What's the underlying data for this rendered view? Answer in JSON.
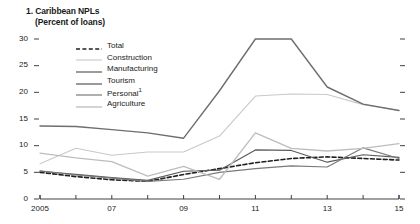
{
  "panel": {
    "number": "1.",
    "title": "1. Caribbean NPLs",
    "subtitle": "(Percent of loans)"
  },
  "chart_data": {
    "type": "line",
    "title": "1. Caribbean NPLs",
    "subtitle": "(Percent of loans)",
    "xlabel": "",
    "ylabel": "",
    "ylim": [
      0,
      30
    ],
    "xlim": [
      2005,
      2015
    ],
    "yticks": [
      0,
      5,
      10,
      15,
      20,
      25,
      30
    ],
    "ytick_labels": [
      "0",
      "5",
      "10",
      "15",
      "20",
      "25",
      "30"
    ],
    "x": [
      2005,
      2006,
      2007,
      2008,
      2009,
      2010,
      2011,
      2012,
      2013,
      2014,
      2015
    ],
    "xticks": [
      2005,
      2006,
      2007,
      2008,
      2009,
      2010,
      2011,
      2012,
      2013,
      2014,
      2015
    ],
    "xtick_labels": [
      "2005",
      "",
      "07",
      "",
      "09",
      "",
      "11",
      "",
      "13",
      "",
      "15"
    ],
    "grid": false,
    "legend_position": "upper-center",
    "right_axis_ticks": true,
    "series": [
      {
        "name": "Total",
        "style": "dashed",
        "color": "#1f1f1f",
        "width": 1.6,
        "values": [
          5.0,
          4.2,
          3.6,
          3.3,
          4.6,
          5.7,
          6.8,
          7.6,
          7.9,
          7.6,
          7.3
        ]
      },
      {
        "name": "Construction",
        "style": "solid",
        "color": "#c9c9c9",
        "width": 1.1,
        "values": [
          6.6,
          9.5,
          8.2,
          8.8,
          8.8,
          11.8,
          19.3,
          19.7,
          19.6,
          17.7,
          16.6
        ]
      },
      {
        "name": "Manufacturing",
        "style": "solid",
        "color": "#5a5a5a",
        "width": 1.2,
        "values": [
          5.2,
          4.6,
          4.0,
          3.5,
          5.2,
          5.4,
          9.2,
          9.1,
          6.9,
          8.3,
          7.8
        ]
      },
      {
        "name": "Tourism",
        "style": "solid",
        "color": "#6e6e6e",
        "width": 1.4,
        "values": [
          13.7,
          13.6,
          13.0,
          12.4,
          11.4,
          20.3,
          30.0,
          30.0,
          21.0,
          17.8,
          16.6
        ]
      },
      {
        "name": "Personal",
        "style": "solid",
        "color": "#7a7a7a",
        "width": 1.2,
        "values": [
          5.3,
          4.5,
          3.9,
          3.3,
          3.7,
          5.0,
          5.7,
          6.2,
          6.0,
          9.6,
          7.6
        ]
      },
      {
        "name": "Agriculture",
        "style": "solid",
        "color": "#bdbdbd",
        "width": 1.3,
        "values": [
          8.6,
          7.7,
          7.0,
          4.3,
          6.1,
          3.7,
          12.4,
          9.5,
          9.0,
          9.5,
          10.4
        ]
      }
    ],
    "legend_entries": [
      {
        "label": "Total",
        "footnote": ""
      },
      {
        "label": "Construction",
        "footnote": ""
      },
      {
        "label": "Manufacturing",
        "footnote": ""
      },
      {
        "label": "Tourism",
        "footnote": ""
      },
      {
        "label": "Personal",
        "footnote": "1"
      },
      {
        "label": "Agriculture",
        "footnote": ""
      }
    ]
  }
}
